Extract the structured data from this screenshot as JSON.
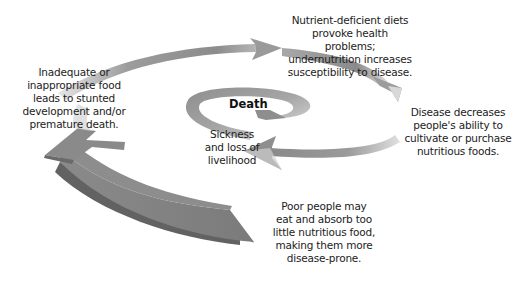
{
  "diagram": {
    "type": "spiral-cycle",
    "center_label": "Death",
    "steps": [
      {
        "id": "nutrient-deficient",
        "lines": [
          "Nutrient-deficient diets",
          "provoke health",
          "problems;",
          "undernutrition increases",
          "susceptibility to disease."
        ]
      },
      {
        "id": "disease-decreases",
        "lines": [
          "Disease decreases",
          "people's ability to",
          "cultivate or purchase",
          "nutritious foods."
        ]
      },
      {
        "id": "poor-people",
        "lines": [
          "Poor people may",
          "eat and absorb too",
          "little nutritious food,",
          "making them more",
          "disease-prone."
        ]
      },
      {
        "id": "inadequate-food",
        "lines": [
          "Inadequate or",
          "inappropriate food",
          "leads to stunted",
          "development and/or",
          "premature death."
        ]
      },
      {
        "id": "sickness",
        "lines": [
          "Sickness",
          "and loss of",
          "livelihood"
        ]
      }
    ],
    "colors": {
      "arrow_dark": "#7a7a7a",
      "arrow_mid": "#9a9a9a",
      "arrow_light": "#d8d8d8",
      "arrow_shadow": "#5e5e5e",
      "text": "#1c1c1c"
    }
  }
}
